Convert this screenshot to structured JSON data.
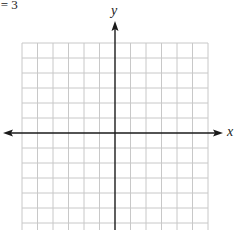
{
  "caption": "x = 3",
  "axes": {
    "x_label": "x",
    "y_label": "y"
  },
  "grid": {
    "columns": 12,
    "rows_visible": 12,
    "cell_size_px": 15.5,
    "line_color": "#c8c8c8",
    "axis_color": "#1a1a1a"
  }
}
